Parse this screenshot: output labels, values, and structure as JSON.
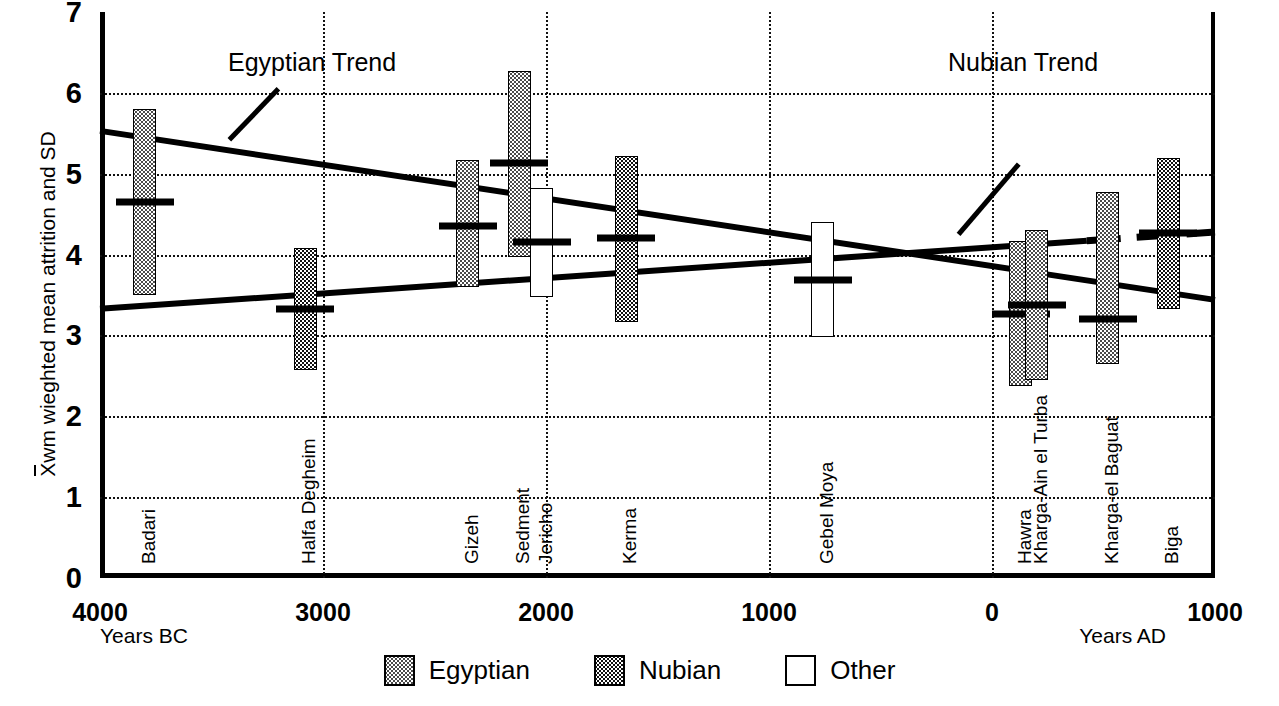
{
  "chart_data": {
    "type": "bar",
    "title": "",
    "ylabel": "X̄wm wieghted mean attrition and SD",
    "ylabel_parts": {
      "overline_char": "X",
      "rest": "wm wieghted mean attrition and SD"
    },
    "xlabel_left": "Years BC",
    "xlabel_right": "Years AD",
    "ylim": [
      0,
      7
    ],
    "yticks": [
      0,
      1,
      2,
      3,
      4,
      5,
      6,
      7
    ],
    "xlim_bc_ad": [
      -4000,
      1000
    ],
    "xticks": [
      {
        "label": "4000",
        "value": -4000
      },
      {
        "label": "3000",
        "value": -3000
      },
      {
        "label": "2000",
        "value": -2000
      },
      {
        "label": "1000",
        "value": -1000
      },
      {
        "label": "0",
        "value": 0
      },
      {
        "label": "1000",
        "value": 1000
      }
    ],
    "grid": "dotted-both",
    "legend_position": "bottom-center",
    "legend": [
      {
        "key": "egyptian",
        "label": "Egyptian",
        "fill": "light-dotted"
      },
      {
        "key": "nubian",
        "label": "Nubian",
        "fill": "dark-checked"
      },
      {
        "key": "other",
        "label": "Other",
        "fill": "white"
      }
    ],
    "series_note": "Each bar spans mean ± SD of weighted mean attrition; horizontal tick marks the mean.",
    "sites": [
      {
        "name": "Badari",
        "group": "egyptian",
        "x": -3800,
        "mean": 4.65,
        "low": 3.5,
        "high": 5.8
      },
      {
        "name": "Halfa Degheim",
        "group": "nubian",
        "x": -3080,
        "mean": 3.33,
        "low": 2.57,
        "high": 4.08
      },
      {
        "name": "Gizeh",
        "group": "egyptian",
        "x": -2350,
        "mean": 4.35,
        "low": 3.6,
        "high": 5.17
      },
      {
        "name": "Sedment",
        "group": "egyptian",
        "x": -2120,
        "mean": 5.13,
        "low": 3.97,
        "high": 6.27
      },
      {
        "name": "Jericho",
        "group": "other",
        "x": -2020,
        "mean": 4.15,
        "low": 3.48,
        "high": 4.82
      },
      {
        "name": "Kerma",
        "group": "nubian",
        "x": -1640,
        "mean": 4.2,
        "low": 3.17,
        "high": 5.22
      },
      {
        "name": "Gebel Moya",
        "group": "other",
        "x": -760,
        "mean": 3.68,
        "low": 2.98,
        "high": 4.4
      },
      {
        "name": "Hawra",
        "group": "egyptian",
        "x": 130,
        "mean": 3.27,
        "low": 2.38,
        "high": 4.17
      },
      {
        "name": "Kharga-Ain el Turba",
        "group": "egyptian",
        "x": 200,
        "mean": 3.38,
        "low": 2.45,
        "high": 4.3
      },
      {
        "name": "Kharga-el Baguat",
        "group": "egyptian",
        "x": 520,
        "mean": 3.2,
        "low": 2.65,
        "high": 4.78
      },
      {
        "name": "Biga",
        "group": "nubian",
        "x": 790,
        "mean": 4.27,
        "low": 3.33,
        "high": 5.2
      }
    ],
    "trends": [
      {
        "name": "Egyptian Trend",
        "label": "Egyptian Trend",
        "x_start": -4000,
        "y_start": 5.53,
        "x_end": 1000,
        "y_end": 3.44,
        "dash_gap": {
          "from": 0,
          "to": 260
        },
        "leader": {
          "x1": -3420,
          "y1": 5.42,
          "x2": -3200,
          "y2": 6.05
        }
      },
      {
        "name": "Nubian Trend",
        "label": "Nubian Trend",
        "x_start": -4000,
        "y_start": 3.33,
        "x_end": 1000,
        "y_end": 4.28,
        "dash_gap": {
          "from": 420,
          "to": 1000
        },
        "leader": {
          "x1": -150,
          "y1": 4.25,
          "x2": 120,
          "y2": 5.12
        }
      }
    ],
    "annotations": [
      {
        "text": "Egyptian Trend",
        "x_px": 228,
        "y_px": 48
      },
      {
        "text": "Nubian Trend",
        "x_px": 948,
        "y_px": 48
      }
    ]
  }
}
